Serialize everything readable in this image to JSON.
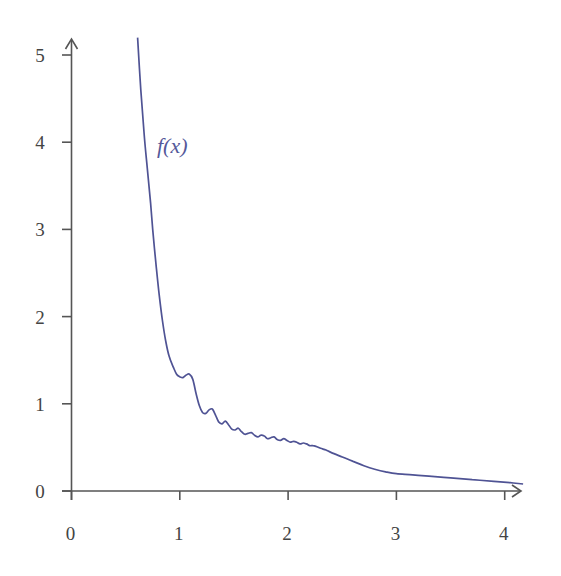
{
  "chart_data": {
    "type": "line",
    "title": "",
    "xlabel": "",
    "ylabel": "",
    "xlim": [
      0,
      4.2
    ],
    "ylim": [
      0,
      5.2
    ],
    "x_ticks": [
      "0",
      "1",
      "2",
      "3",
      "4"
    ],
    "y_ticks": [
      "0",
      "1",
      "2",
      "3",
      "4",
      "5"
    ],
    "grid": false,
    "legend": null,
    "annotations": [
      {
        "text": "f(x)",
        "x": 0.88,
        "y": 3.9
      }
    ],
    "colors": {
      "curve": "#4f5394",
      "axes": "#555555",
      "label": "#55599a"
    },
    "series": [
      {
        "name": "f(x)",
        "points": [
          [
            0.61,
            5.2
          ],
          [
            0.64,
            4.6
          ],
          [
            0.67,
            4.1
          ],
          [
            0.7,
            3.7
          ],
          [
            0.73,
            3.3
          ],
          [
            0.75,
            3.0
          ],
          [
            0.78,
            2.6
          ],
          [
            0.81,
            2.25
          ],
          [
            0.84,
            1.95
          ],
          [
            0.87,
            1.72
          ],
          [
            0.9,
            1.55
          ],
          [
            0.94,
            1.42
          ],
          [
            0.97,
            1.34
          ],
          [
            1.0,
            1.31
          ],
          [
            1.03,
            1.3
          ],
          [
            1.06,
            1.33
          ],
          [
            1.09,
            1.34
          ],
          [
            1.12,
            1.28
          ],
          [
            1.15,
            1.12
          ],
          [
            1.18,
            0.98
          ],
          [
            1.21,
            0.9
          ],
          [
            1.24,
            0.89
          ],
          [
            1.27,
            0.93
          ],
          [
            1.3,
            0.94
          ],
          [
            1.33,
            0.87
          ],
          [
            1.36,
            0.79
          ],
          [
            1.39,
            0.77
          ],
          [
            1.42,
            0.8
          ],
          [
            1.45,
            0.76
          ],
          [
            1.48,
            0.71
          ],
          [
            1.51,
            0.7
          ],
          [
            1.54,
            0.72
          ],
          [
            1.57,
            0.68
          ],
          [
            1.6,
            0.65
          ],
          [
            1.63,
            0.66
          ],
          [
            1.66,
            0.67
          ],
          [
            1.69,
            0.64
          ],
          [
            1.72,
            0.62
          ],
          [
            1.75,
            0.64
          ],
          [
            1.78,
            0.63
          ],
          [
            1.81,
            0.6
          ],
          [
            1.84,
            0.61
          ],
          [
            1.87,
            0.62
          ],
          [
            1.9,
            0.59
          ],
          [
            1.93,
            0.58
          ],
          [
            1.96,
            0.6
          ],
          [
            1.99,
            0.58
          ],
          [
            2.02,
            0.56
          ],
          [
            2.05,
            0.57
          ],
          [
            2.08,
            0.56
          ],
          [
            2.11,
            0.54
          ],
          [
            2.14,
            0.55
          ],
          [
            2.17,
            0.54
          ],
          [
            2.2,
            0.52
          ],
          [
            2.23,
            0.52
          ],
          [
            2.26,
            0.51
          ],
          [
            2.3,
            0.49
          ],
          [
            2.35,
            0.47
          ],
          [
            2.4,
            0.44
          ],
          [
            2.5,
            0.39
          ],
          [
            2.6,
            0.34
          ],
          [
            2.7,
            0.29
          ],
          [
            2.8,
            0.25
          ],
          [
            2.9,
            0.22
          ],
          [
            3.0,
            0.2
          ],
          [
            3.15,
            0.185
          ],
          [
            3.3,
            0.17
          ],
          [
            3.5,
            0.15
          ],
          [
            3.7,
            0.13
          ],
          [
            3.9,
            0.11
          ],
          [
            4.05,
            0.095
          ],
          [
            4.17,
            0.08
          ]
        ]
      }
    ]
  }
}
